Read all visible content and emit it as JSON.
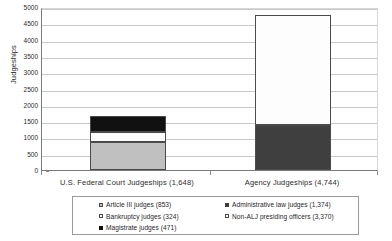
{
  "chart_data": {
    "type": "bar",
    "stacked": true,
    "title": "",
    "xlabel": "",
    "ylabel": "Judgeships",
    "ylim": [
      0,
      5000
    ],
    "ytick_step": 500,
    "grid": true,
    "legend_position": "bottom",
    "categories": [
      "U.S. Federal Court Judgeships (1,648)",
      "Agency Judgeships (4,744)"
    ],
    "category_totals": [
      1648,
      4744
    ],
    "series": [
      {
        "name": "Article III judges (853)",
        "label": "Article III judges (853)",
        "value": 853,
        "category": "U.S. Federal Court Judgeships (1,648)",
        "color": "#c0c0c0",
        "swatch": "light"
      },
      {
        "name": "Bankruptcy judges (324)",
        "label": "Bankruptcy judges (324)",
        "value": 324,
        "category": "U.S. Federal Court Judgeships (1,648)",
        "color": "#ffffff",
        "swatch": "white"
      },
      {
        "name": "Magistrate judges (471)",
        "label": "Magistrate judges (471)",
        "value": 471,
        "category": "U.S. Federal Court Judgeships (1,648)",
        "color": "#111111",
        "swatch": "black"
      },
      {
        "name": "Administrative law judges (1,374)",
        "label": "Administrative law judges (1,374)",
        "value": 1374,
        "category": "Agency Judgeships (4,744)",
        "color": "#3f3f3f",
        "swatch": "dark"
      },
      {
        "name": "Non-ALJ presiding officers (3,370)",
        "label": "Non-ALJ presiding officers (3,370)",
        "value": 3370,
        "category": "Agency Judgeships (4,744)",
        "color": "#ffffff",
        "swatch": "white"
      }
    ],
    "ytick_labels": [
      "5000",
      "4500",
      "4000",
      "3500",
      "3000",
      "2500",
      "2000",
      "1500",
      "1000",
      "500",
      "0"
    ]
  },
  "axis": {
    "y_title": "Judgeships",
    "y_ticks": [
      {
        "label": "5000",
        "value": 5000
      },
      {
        "label": "4500",
        "value": 4500
      },
      {
        "label": "4000",
        "value": 4000
      },
      {
        "label": "3500",
        "value": 3500
      },
      {
        "label": "3000",
        "value": 3000
      },
      {
        "label": "2500",
        "value": 2500
      },
      {
        "label": "2000",
        "value": 2000
      },
      {
        "label": "1500",
        "value": 1500
      },
      {
        "label": "1000",
        "value": 1000
      },
      {
        "label": "500",
        "value": 500
      },
      {
        "label": "0",
        "value": 0
      }
    ],
    "x_labels": [
      "U.S. Federal Court Judgeships (1,648)",
      "Agency Judgeships (4,744)"
    ]
  },
  "legend": {
    "left_column": [
      "Article III judges (853)",
      "Bankruptcy judges (324)",
      "Magistrate judges (471)"
    ],
    "right_column": [
      "Administrative law judges (1,374)",
      "Non-ALJ presiding officers (3,370)"
    ]
  }
}
